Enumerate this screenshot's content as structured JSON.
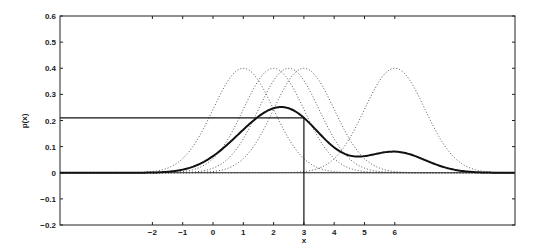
{
  "chart_data": {
    "type": "line",
    "title": "",
    "xlabel": "x",
    "ylabel": "p(x)",
    "xlim": [
      -4.9,
      10.1
    ],
    "ylim": [
      -0.2,
      0.6
    ],
    "grid": false,
    "legend": null,
    "x_ticks": [
      -2,
      -1,
      0,
      1,
      2,
      3,
      4,
      5,
      6
    ],
    "x_tick_labels": [
      "−2",
      "−1",
      "0",
      "1",
      "2",
      "3",
      "4",
      "5",
      "6"
    ],
    "y_ticks": [
      -0.2,
      -0.1,
      0,
      0.1,
      0.2,
      0.3,
      0.4,
      0.5,
      0.6
    ],
    "y_tick_labels": [
      "−0.2",
      "−0.1",
      "0",
      "0.1",
      "0.2",
      "0.3",
      "0.4",
      "0.5",
      "0.6"
    ],
    "series": [
      {
        "name": "kernel at x=1",
        "style": "dotted",
        "type": "gaussian",
        "mean": 1,
        "sigma": 1,
        "peak": 0.4
      },
      {
        "name": "kernel at x=2",
        "style": "dotted",
        "type": "gaussian",
        "mean": 2,
        "sigma": 1,
        "peak": 0.4
      },
      {
        "name": "kernel at x=2.5",
        "style": "dotted",
        "type": "gaussian",
        "mean": 2.5,
        "sigma": 1,
        "peak": 0.4
      },
      {
        "name": "kernel at x=3",
        "style": "dotted",
        "type": "gaussian",
        "mean": 3,
        "sigma": 1,
        "peak": 0.4
      },
      {
        "name": "kernel at x=6",
        "style": "dotted",
        "type": "gaussian",
        "mean": 6,
        "sigma": 1,
        "peak": 0.4
      },
      {
        "name": "density estimate p(x)",
        "style": "solid-bold",
        "type": "mixture",
        "components": [
          1,
          2,
          2.5,
          3,
          6
        ],
        "sigma": 1,
        "sample_points": {
          "x": [
            -2,
            0,
            1,
            2,
            2.1,
            3,
            4,
            5,
            6,
            7,
            8
          ],
          "y": [
            0.0,
            0.03,
            0.13,
            0.247,
            0.25,
            0.21,
            0.11,
            0.07,
            0.08,
            0.05,
            0.01
          ]
        }
      }
    ],
    "annotations": [
      {
        "type": "vertical-line",
        "x": 3,
        "from_y": -0.2,
        "to_y": 0.21
      },
      {
        "type": "horizontal-line",
        "y": 0.21,
        "from_x": "left-axis",
        "to_x": 3
      }
    ]
  }
}
